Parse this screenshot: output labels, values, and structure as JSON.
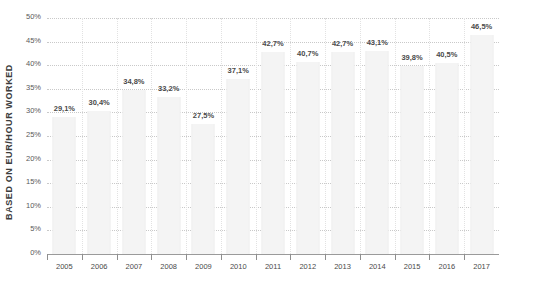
{
  "chart_data": {
    "type": "bar",
    "title": "",
    "xlabel": "",
    "ylabel": "BASED ON EUR/HOUR WORKED",
    "categories": [
      "2005",
      "2006",
      "2007",
      "2008",
      "2009",
      "2010",
      "2011",
      "2012",
      "2013",
      "2014",
      "2015",
      "2016",
      "2017"
    ],
    "values": [
      29.1,
      30.4,
      34.8,
      33.2,
      27.5,
      37.1,
      42.7,
      40.7,
      42.7,
      43.1,
      39.8,
      40.5,
      46.5
    ],
    "value_labels": [
      "29,1%",
      "30,4%",
      "34,8%",
      "33,2%",
      "27,5%",
      "37,1%",
      "42,7%",
      "40,7%",
      "42,7%",
      "43,1%",
      "39,8%",
      "40,5%",
      "46,5%"
    ],
    "ylim": [
      0,
      50
    ],
    "y_tick_labels": [
      "50%",
      "45%",
      "40%",
      "35%",
      "30%",
      "25%",
      "20%",
      "15%",
      "10%",
      "5%",
      "0%"
    ],
    "y_tick_values": [
      50,
      45,
      40,
      35,
      30,
      25,
      20,
      15,
      10,
      5,
      0
    ],
    "grid": true,
    "legend": "none",
    "bar_color": "#f4f4f4",
    "grid_color": "#c9c9c9",
    "label_color": "#4a4a4a"
  },
  "caption": {
    "figure_label": "FIGURE"
  }
}
